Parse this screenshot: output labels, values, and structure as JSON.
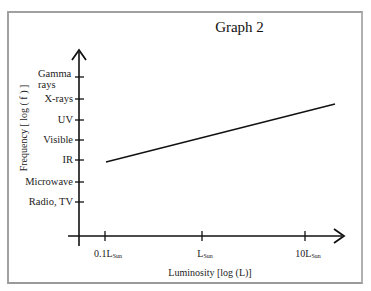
{
  "chart_data": {
    "type": "line",
    "title": "Graph 2",
    "xlabel": "Luminosity [log (L)]",
    "ylabel": "Frequency [ log ( f ) ]",
    "x_tick_labels": [
      {
        "main": "0.1L",
        "sub": "Sun"
      },
      {
        "main": "L",
        "sub": "Sun"
      },
      {
        "main": "10L",
        "sub": "Sun"
      }
    ],
    "y_tick_labels": [
      "Radio, TV",
      "Microwave",
      "IR",
      "Visible",
      "UV",
      "X-rays",
      "Gamma rays"
    ],
    "x_scale": "log",
    "y_scale": "log",
    "grid": false,
    "legend": null,
    "series": [
      {
        "name": "Frequency vs Luminosity",
        "x": [
          "0.1L_Sun",
          "~15L_Sun"
        ],
        "x_log_values": [
          -1,
          1.3
        ],
        "y_levels": [
          2.05,
          4.9
        ],
        "description": "Straight increasing line starting just above IR at 0.1 L_Sun, rising to between UV and X-rays beyond 10 L_Sun"
      }
    ],
    "color": "#111111"
  }
}
